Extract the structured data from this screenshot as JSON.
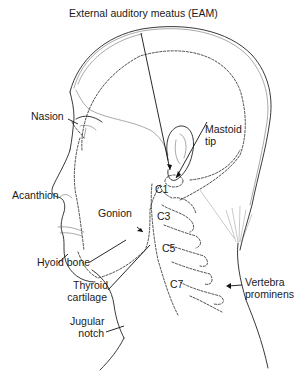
{
  "figure": {
    "type": "anatomical-diagram",
    "colors": {
      "line": "#222222",
      "background": "#ffffff",
      "text": "#1a1a1a"
    }
  },
  "labels": {
    "eam": "External auditory meatus (EAM)",
    "nasion": "Nasion",
    "mastoid_line1": "Mastoid",
    "mastoid_line2": "tip",
    "acanthion": "Acanthion",
    "gonion": "Gonion",
    "c1": "C1",
    "c3": "C3",
    "c5": "C5",
    "c7": "C7",
    "hyoid": "Hyoid bone",
    "thyroid_line1": "Thyroid",
    "thyroid_line2": "cartilage",
    "jugular_line1": "Jugular",
    "jugular_line2": "notch",
    "vertebra_line1": "Vertebra",
    "vertebra_line2": "prominens"
  }
}
